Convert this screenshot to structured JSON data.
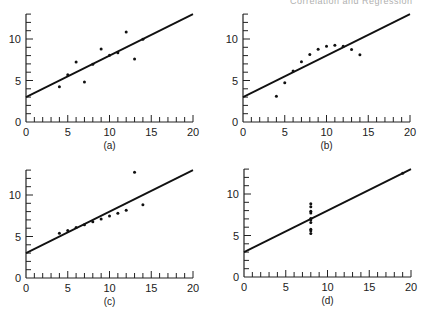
{
  "header": {
    "text": "Correlation and Regression"
  },
  "chart_data": [
    {
      "type": "scatter",
      "label": "(a)",
      "xlim": [
        0,
        20
      ],
      "ylim": [
        0,
        13
      ],
      "xticks": [
        0,
        5,
        10,
        15,
        20
      ],
      "yticks": [
        0,
        5,
        10
      ],
      "fit": {
        "intercept": 3.0,
        "slope": 0.5
      },
      "x": [
        10,
        8,
        13,
        9,
        11,
        14,
        6,
        4,
        12,
        7,
        5
      ],
      "y": [
        8.04,
        6.95,
        7.58,
        8.81,
        8.33,
        9.96,
        7.24,
        4.26,
        10.84,
        4.82,
        5.68
      ]
    },
    {
      "type": "scatter",
      "label": "(b)",
      "xlim": [
        0,
        20
      ],
      "ylim": [
        0,
        13
      ],
      "xticks": [
        0,
        5,
        10,
        15,
        20
      ],
      "yticks": [
        0,
        5,
        10
      ],
      "fit": {
        "intercept": 3.0,
        "slope": 0.5
      },
      "x": [
        10,
        8,
        13,
        9,
        11,
        14,
        6,
        4,
        12,
        7,
        5
      ],
      "y": [
        9.14,
        8.14,
        8.74,
        8.77,
        9.26,
        8.1,
        6.13,
        3.1,
        9.13,
        7.26,
        4.74
      ]
    },
    {
      "type": "scatter",
      "label": "(c)",
      "xlim": [
        0,
        20
      ],
      "ylim": [
        0,
        13
      ],
      "xticks": [
        0,
        5,
        10,
        15,
        20
      ],
      "yticks": [
        0,
        5,
        10
      ],
      "fit": {
        "intercept": 3.0,
        "slope": 0.5
      },
      "x": [
        10,
        8,
        13,
        9,
        11,
        14,
        6,
        4,
        12,
        7,
        5
      ],
      "y": [
        7.46,
        6.77,
        12.74,
        7.11,
        7.81,
        8.84,
        6.08,
        5.39,
        8.15,
        6.42,
        5.73
      ]
    },
    {
      "type": "scatter",
      "label": "(d)",
      "xlim": [
        0,
        20
      ],
      "ylim": [
        0,
        13
      ],
      "xticks": [
        0,
        5,
        10,
        15,
        20
      ],
      "yticks": [
        0,
        5,
        10
      ],
      "fit": {
        "intercept": 3.0,
        "slope": 0.5
      },
      "x": [
        8,
        8,
        8,
        8,
        8,
        8,
        8,
        19,
        8,
        8,
        8
      ],
      "y": [
        6.58,
        5.76,
        7.71,
        8.84,
        8.47,
        7.04,
        5.25,
        12.5,
        5.56,
        7.91,
        6.89
      ]
    }
  ],
  "panels": {
    "origins": [
      [
        26,
        122
      ],
      [
        243,
        122
      ],
      [
        26,
        278
      ],
      [
        244,
        277
      ]
    ],
    "px_per_x": 8.35,
    "px_per_y": 8.3
  }
}
